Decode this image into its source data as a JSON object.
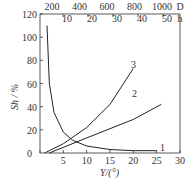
{
  "chart_data": {
    "type": "line",
    "title": "",
    "xlabel": "Y/(°)",
    "ylabel": "S_h/%",
    "xlim": [
      0,
      30
    ],
    "ylim": [
      0,
      120
    ],
    "x_ticks": [
      "0",
      "5",
      "10",
      "15",
      "20",
      "25",
      "30"
    ],
    "y_ticks": [
      "0",
      "20",
      "40",
      "60",
      "80",
      "100",
      "120"
    ],
    "top_axis_D": {
      "label": "D",
      "ticks": [
        "200",
        "400",
        "600",
        "800",
        "1000"
      ]
    },
    "top_axis_h": {
      "label": "h",
      "ticks": [
        "10",
        "20",
        "30",
        "40",
        "50"
      ]
    },
    "grid": false,
    "series": [
      {
        "name": "1",
        "x": [
          1.5,
          2,
          3,
          5,
          7,
          10,
          15,
          20,
          25
        ],
        "y": [
          110,
          60,
          35,
          18,
          11,
          6,
          3,
          2,
          2
        ]
      },
      {
        "name": "2",
        "x": [
          2,
          10,
          20,
          26
        ],
        "y": [
          0,
          13,
          29,
          42
        ]
      },
      {
        "name": "3",
        "x": [
          1,
          5,
          10,
          15,
          20
        ],
        "y": [
          0,
          8,
          22,
          42,
          73
        ]
      }
    ]
  },
  "labels": {
    "c1": "1",
    "c2": "2",
    "c3": "3",
    "xlabel": "Y/(°)",
    "ylabel": "Sh / %",
    "d": "D",
    "h": "h"
  }
}
